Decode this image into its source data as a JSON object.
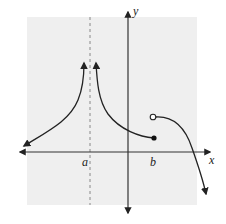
{
  "figure": {
    "type": "function-graph",
    "background_color": "#efefef",
    "axis_color": "#333333",
    "curve_color": "#222222",
    "asymptote_color": "#888888"
  },
  "axes": {
    "x_label": "x",
    "y_label": "y"
  },
  "markers": {
    "a_label": "a",
    "b_label": "b"
  },
  "features": {
    "vertical_asymptote": "x = a (dashed line)",
    "left_branch": "rises toward +infinity as x approaches a from the left; arrow extends down-left",
    "middle_branch": "descends from +infinity right of a to a closed point at x = b",
    "closed_point": "filled dot at x = b",
    "open_point": "open circle at x = b, above the closed point",
    "right_branch": "starts at open circle, decreases, crosses x-axis, arrow continues downward"
  }
}
